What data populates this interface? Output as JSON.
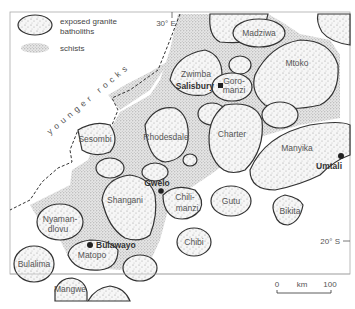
{
  "legend": {
    "items": [
      {
        "symbol": "granite-batholith",
        "label_line1": "exposed granite",
        "label_line2": "batholiths"
      },
      {
        "symbol": "schist",
        "label": "schists"
      }
    ]
  },
  "graticule": {
    "longitude_label": "30° E",
    "latitude_label": "20° S"
  },
  "boundary_label": "younger rocks",
  "batholiths": [
    {
      "name": "Madziwa"
    },
    {
      "name": "Mtoko"
    },
    {
      "name": "Zwimba"
    },
    {
      "name": "Goro-\nmanzi",
      "line1": "Goro-",
      "line2": "manzi"
    },
    {
      "name": "Sesombi"
    },
    {
      "name": "Rhodesdale"
    },
    {
      "name": "Charter"
    },
    {
      "name": "Manyika"
    },
    {
      "name": "Shangani"
    },
    {
      "name": "Chilimanzi",
      "line1": "Chili-",
      "line2": "manzi"
    },
    {
      "name": "Gutu"
    },
    {
      "name": "Bikita"
    },
    {
      "name": "Nyamandlovu",
      "line1": "Nyaman-",
      "line2": "dlovu"
    },
    {
      "name": "Matopo"
    },
    {
      "name": "Chibi"
    },
    {
      "name": "Bulalima"
    },
    {
      "name": "Mangwe"
    }
  ],
  "towns": [
    {
      "name": "Salisbury",
      "symbol": "square"
    },
    {
      "name": "Umtali",
      "symbol": "dot"
    },
    {
      "name": "Gwelo",
      "symbol": "dot"
    },
    {
      "name": "Bulawayo",
      "symbol": "dot"
    }
  ],
  "scale_bar": {
    "start": "0",
    "unit": "km",
    "end": "100"
  }
}
